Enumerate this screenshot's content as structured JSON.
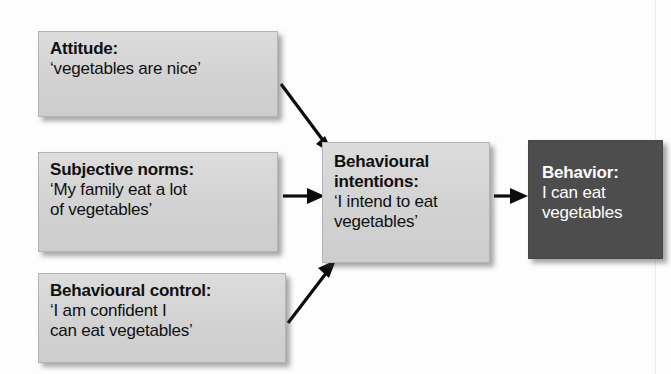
{
  "diagram": {
    "background_color": "#fdfdfd",
    "box_fill_light": "#d6d6d6",
    "box_fill_dark": "#4d4d4d",
    "box_text_light": "#101010",
    "box_text_dark": "#ffffff",
    "arrow_color": "#0d0d0d"
  },
  "nodes": {
    "attitude": {
      "title": "Attitude:",
      "body": "‘vegetables are nice’"
    },
    "subjective_norms": {
      "title": "Subjective norms:",
      "body_line1": "‘My family eat a lot",
      "body_line2": "of vegetables’"
    },
    "behavioural_control": {
      "title": "Behavioural control:",
      "body_line1": "‘I am confident I",
      "body_line2": "can eat vegetables’"
    },
    "behavioural_intentions": {
      "title_line1": "Behavioural",
      "title_line2": "intentions:",
      "body_line1": "‘I intend to eat",
      "body_line2": "vegetables’"
    },
    "behavior": {
      "title": "Behavior:",
      "body_line1": "I can eat",
      "body_line2": "vegetables"
    }
  },
  "arrows": [
    {
      "name": "attitude-to-intentions",
      "from": "attitude",
      "to": "behavioural_intentions",
      "direction": "diagonal-down-right"
    },
    {
      "name": "subjective-norms-to-intentions",
      "from": "subjective_norms",
      "to": "behavioural_intentions",
      "direction": "horizontal-right"
    },
    {
      "name": "behavioural-control-to-intentions",
      "from": "behavioural_control",
      "to": "behavioural_intentions",
      "direction": "diagonal-up-right"
    },
    {
      "name": "intentions-to-behavior",
      "from": "behavioural_intentions",
      "to": "behavior",
      "direction": "horizontal-right"
    }
  ]
}
